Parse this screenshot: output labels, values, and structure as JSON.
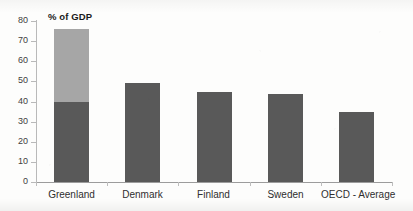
{
  "chart_data": {
    "type": "bar",
    "title": "",
    "subtitle": "",
    "series_label": "% of GDP",
    "xlabel": "",
    "ylabel": "",
    "ylim": [
      0,
      80
    ],
    "ytick_step": 10,
    "ytick_labels": [
      "80",
      "70",
      "60",
      "50",
      "40",
      "30",
      "20",
      "10",
      "0"
    ],
    "ytick_values": [
      80,
      70,
      60,
      50,
      40,
      30,
      20,
      10,
      0
    ],
    "grid": false,
    "legend": "none",
    "categories": [
      "Greenland",
      "Denmark",
      "Finland",
      "Sweden",
      "OECD - Average"
    ],
    "values": [
      76,
      49,
      44.5,
      43.5,
      35
    ],
    "stacked_first_bar": {
      "category": "Greenland",
      "lower_segment_value": 40,
      "upper_segment_value": 36,
      "total": 76
    },
    "series": [
      {
        "name": "% of GDP",
        "values": [
          40,
          49,
          44.5,
          43.5,
          35
        ],
        "color": "#595959"
      },
      {
        "name": "% of GDP (upper segment)",
        "values": [
          36,
          0,
          0,
          0,
          0
        ],
        "color": "#a6a6a6"
      }
    ],
    "colors": {
      "bar_dark": "#595959",
      "bar_light": "#a6a6a6",
      "axis": "#b3b3b3",
      "text": "#2f2f2f",
      "background": "#fdfdfc"
    }
  }
}
